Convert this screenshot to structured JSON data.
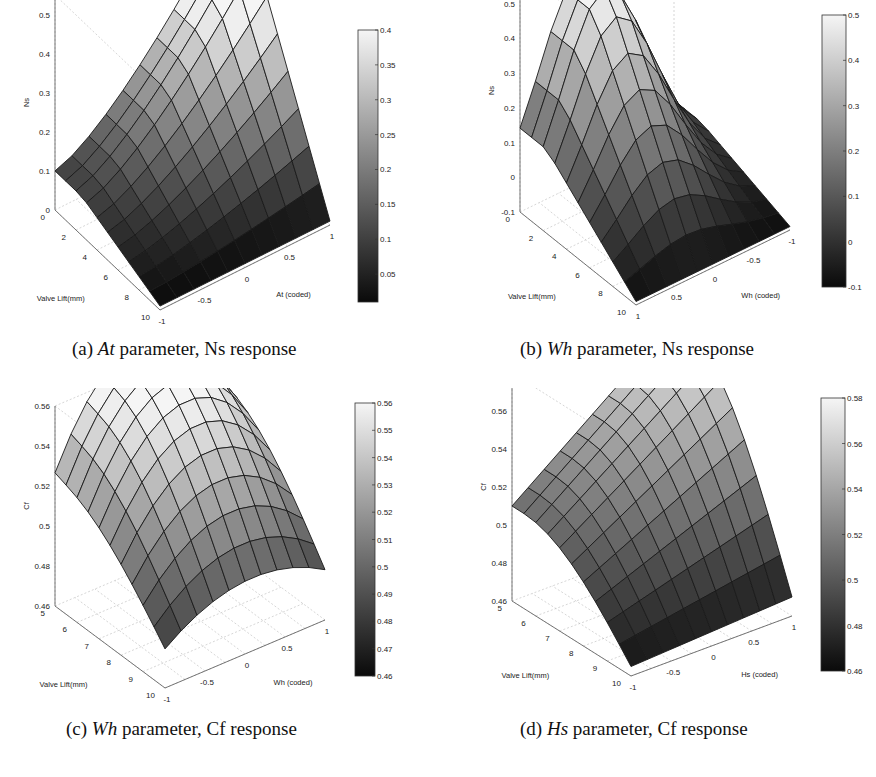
{
  "chart_data": [
    {
      "id": "a",
      "type": "surface",
      "caption": {
        "prefix": "(a) ",
        "param": "At",
        "suffix": " parameter, Ns response"
      },
      "xlabel": "At (coded)",
      "ylabel": "Valve Lift(mm)",
      "zlabel": "Ns",
      "x_ticks": [
        "-1",
        "-0.5",
        "0",
        "0.5",
        "1"
      ],
      "y_ticks": [
        "0",
        "2",
        "4",
        "6",
        "8",
        "10"
      ],
      "z_ticks": [
        "0",
        "0.1",
        "0.2",
        "0.3",
        "0.4",
        "0.5"
      ],
      "zlim": [
        0,
        0.55
      ],
      "colorbar_ticks": [
        "0.4",
        "0.35",
        "0.3",
        "0.25",
        "0.2",
        "0.15",
        "0.1",
        "0.05"
      ],
      "colorbar_range": [
        0.01,
        0.4
      ],
      "grid": true,
      "surface": {
        "x": [
          -1,
          -0.8,
          -0.6,
          -0.4,
          -0.2,
          0,
          0.2,
          0.4,
          0.6,
          0.8,
          1
        ],
        "y": [
          0,
          1,
          2,
          3,
          4,
          5,
          6,
          7,
          8,
          9,
          10
        ],
        "peak": {
          "x": 1,
          "y": 10,
          "z": 0.52
        },
        "corner_values": {
          "x-1_y0": 0.0,
          "x1_y0": 0.02,
          "x-1_y10": 0.09,
          "x1_y10": 0.52
        }
      }
    },
    {
      "id": "b",
      "type": "surface",
      "caption": {
        "prefix": "(b) ",
        "param": "Wh",
        "suffix": " parameter, Ns response"
      },
      "xlabel": "Wh (coded)",
      "ylabel": "Valve Lift(mm)",
      "zlabel": "Ns",
      "x_ticks": [
        "1",
        "0.5",
        "0",
        "-0.5",
        "-1"
      ],
      "y_ticks": [
        "0",
        "2",
        "4",
        "6",
        "8",
        "10"
      ],
      "z_ticks": [
        "-0.1",
        "0",
        "0.1",
        "0.2",
        "0.3",
        "0.4",
        "0.5",
        "0.6"
      ],
      "zlim": [
        -0.1,
        0.6
      ],
      "colorbar_ticks": [
        "0.5",
        "0.4",
        "0.3",
        "0.2",
        "0.1",
        "0",
        "-0.1"
      ],
      "colorbar_range": [
        -0.1,
        0.5
      ],
      "grid": true,
      "surface": {
        "x": [
          1,
          0.8,
          0.6,
          0.4,
          0.2,
          0,
          -0.2,
          -0.4,
          -0.6,
          -0.8,
          -1
        ],
        "y": [
          0,
          1,
          2,
          3,
          4,
          5,
          6,
          7,
          8,
          9,
          10
        ],
        "peak": {
          "x": -0.2,
          "y": 10,
          "z": 0.55
        },
        "corner_values": {
          "x1_y0": -0.08,
          "x-1_y0": 0.0,
          "x1_y10": -0.05,
          "x-1_y10": 0.45
        }
      }
    },
    {
      "id": "c",
      "type": "surface",
      "caption": {
        "prefix": "(c) ",
        "param": "Wh",
        "suffix": " parameter, Cf response"
      },
      "xlabel": "Wh (coded)",
      "ylabel": "Valve Lift(mm)",
      "zlabel": "Cf",
      "x_ticks": [
        "-1",
        "-0.5",
        "0",
        "0.5",
        "1"
      ],
      "y_ticks": [
        "5",
        "6",
        "7",
        "8",
        "9",
        "10"
      ],
      "z_ticks": [
        "0.46",
        "0.48",
        "0.5",
        "0.52",
        "0.54",
        "0.56"
      ],
      "zlim": [
        0.46,
        0.56
      ],
      "colorbar_ticks": [
        "0.56",
        "0.55",
        "0.54",
        "0.53",
        "0.52",
        "0.51",
        "0.5",
        "0.49",
        "0.48",
        "0.47",
        "0.46"
      ],
      "colorbar_range": [
        0.46,
        0.56
      ],
      "grid": true,
      "surface": {
        "x": [
          -1,
          -0.75,
          -0.5,
          -0.25,
          0,
          0.25,
          0.5,
          0.75,
          1
        ],
        "y": [
          5,
          5.5,
          6,
          6.5,
          7,
          7.5,
          8,
          8.5,
          9,
          9.5,
          10
        ],
        "peak": {
          "x": 0.1,
          "y": 9.2,
          "z": 0.555
        },
        "corner_values": {
          "x-1_y5": 0.465,
          "x1_y5": 0.5,
          "x-1_y10": 0.515,
          "x1_y10": 0.53
        }
      }
    },
    {
      "id": "d",
      "type": "surface",
      "caption": {
        "prefix": "(d) ",
        "param": "Hs",
        "suffix": " parameter, Cf response"
      },
      "xlabel": "Hs (coded)",
      "ylabel": "Valve Lift(mm)",
      "zlabel": "Cf",
      "x_ticks": [
        "-1",
        "-0.5",
        "0",
        "0.5",
        "1"
      ],
      "y_ticks": [
        "5",
        "6",
        "7",
        "8",
        "9",
        "10"
      ],
      "z_ticks": [
        "0.46",
        "0.48",
        "0.5",
        "0.52",
        "0.54",
        "0.56",
        "0.58"
      ],
      "zlim": [
        0.46,
        0.58
      ],
      "colorbar_ticks": [
        "0.58",
        "0.56",
        "0.54",
        "0.52",
        "0.5",
        "0.48",
        "0.46"
      ],
      "colorbar_range": [
        0.46,
        0.58
      ],
      "grid": true,
      "surface": {
        "x": [
          -1,
          -0.75,
          -0.5,
          -0.25,
          0,
          0.25,
          0.5,
          0.75,
          1
        ],
        "y": [
          5,
          5.5,
          6,
          6.5,
          7,
          7.5,
          8,
          8.5,
          9,
          9.5,
          10
        ],
        "peak": {
          "x": 1,
          "y": 9.5,
          "z": 0.575
        },
        "corner_values": {
          "x-1_y5": 0.465,
          "x1_y5": 0.51,
          "x-1_y10": 0.52,
          "x1_y10": 0.57
        }
      }
    }
  ]
}
